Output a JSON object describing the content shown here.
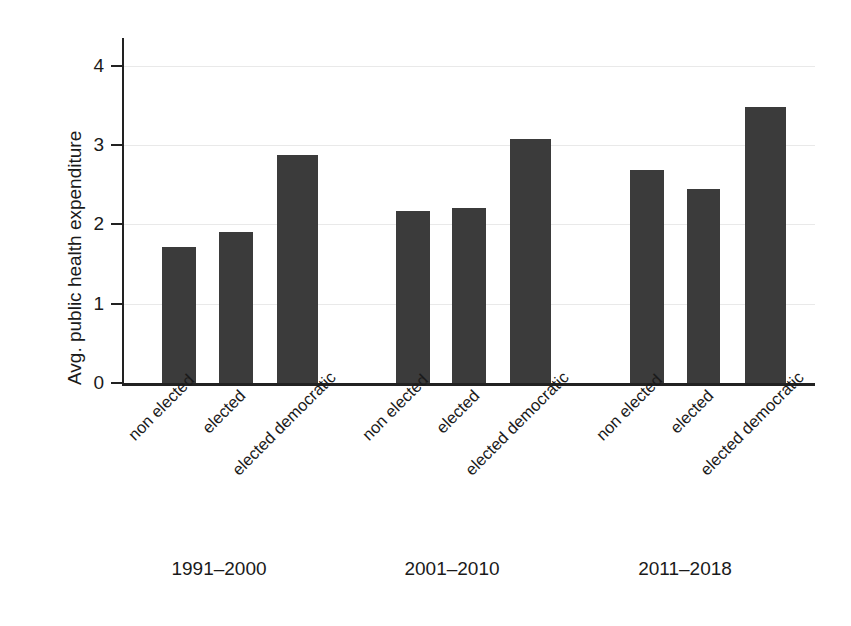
{
  "chart_data": {
    "type": "bar",
    "title": "",
    "xlabel": "",
    "ylabel": "Avg. public health expenditure",
    "ylim": [
      0,
      4.35
    ],
    "yticks": [
      0,
      1,
      2,
      3,
      4
    ],
    "ytick_labels": [
      "0",
      "1",
      "2",
      "3",
      "4"
    ],
    "grid": true,
    "grid_axis": "y",
    "legend": false,
    "legend_position": "none",
    "bar_color": "#3b3b3b",
    "axis_color": "#222222",
    "grid_color": "#e9e9e9",
    "background": "#ffffff",
    "categories": [
      "non elected",
      "elected",
      "elected democratic"
    ],
    "groups": [
      "1991–2000",
      "2001–2010",
      "2011–2018"
    ],
    "group_label_rotation": 0,
    "category_label_rotation": -45,
    "series": [
      {
        "name": "1991–2000",
        "values": [
          1.72,
          1.9,
          2.88
        ]
      },
      {
        "name": "2001–2010",
        "values": [
          2.17,
          2.21,
          3.08
        ]
      },
      {
        "name": "2011–2018",
        "values": [
          2.69,
          2.45,
          3.48
        ]
      }
    ],
    "bars": [
      {
        "group": "1991–2000",
        "category": "non elected",
        "value": 1.72
      },
      {
        "group": "1991–2000",
        "category": "elected",
        "value": 1.9
      },
      {
        "group": "1991–2000",
        "category": "elected democratic",
        "value": 2.88
      },
      {
        "group": "2001–2010",
        "category": "non elected",
        "value": 2.17
      },
      {
        "group": "2001–2010",
        "category": "elected",
        "value": 2.21
      },
      {
        "group": "2001–2010",
        "category": "elected democratic",
        "value": 3.08
      },
      {
        "group": "2011–2018",
        "category": "non elected",
        "value": 2.69
      },
      {
        "group": "2011–2018",
        "category": "elected",
        "value": 2.45
      },
      {
        "group": "2011–2018",
        "category": "elected democratic",
        "value": 3.48
      }
    ]
  },
  "axis": {
    "y_label": "Avg. public health expenditure",
    "y_tick_0": "0",
    "y_tick_1": "1",
    "y_tick_2": "2",
    "y_tick_3": "3",
    "y_tick_4": "4"
  },
  "categories": {
    "g1c1": "non elected",
    "g1c2": "elected",
    "g1c3": "elected democratic",
    "g2c1": "non elected",
    "g2c2": "elected",
    "g2c3": "elected democratic",
    "g3c1": "non elected",
    "g3c2": "elected",
    "g3c3": "elected democratic"
  },
  "groups": {
    "g1": "1991–2000",
    "g2": "2001–2010",
    "g3": "2011–2018"
  }
}
